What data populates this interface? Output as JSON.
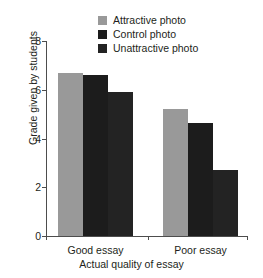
{
  "chart_data": {
    "type": "bar",
    "title": "",
    "xlabel": "Actual quality of essay",
    "ylabel": "Grade given by students",
    "categories": [
      "Good essay",
      "Poor essay"
    ],
    "series": [
      {
        "name": "Attractive photo",
        "color": "#999999",
        "values": [
          6.7,
          5.2
        ]
      },
      {
        "name": "Control photo",
        "color": "#1c1c1c",
        "values": [
          6.6,
          4.65
        ]
      },
      {
        "name": "Unattractive photo",
        "color": "#232323",
        "values": [
          5.9,
          2.7
        ]
      }
    ],
    "ylim": [
      0,
      8
    ],
    "yticks": [
      0,
      2,
      4,
      6,
      8
    ],
    "ytick_labels": [
      "0",
      "2",
      "4",
      "6",
      "8"
    ],
    "grid": false,
    "legend_position": "top-center"
  },
  "axis": {
    "line_color": "#4d4d4d"
  }
}
